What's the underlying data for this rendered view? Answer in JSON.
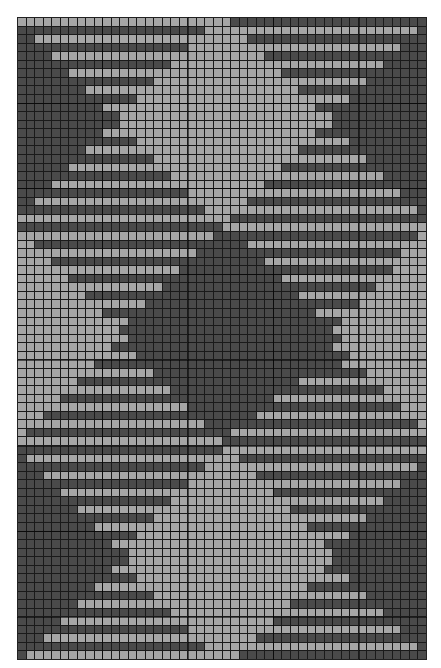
{
  "chart": {
    "cols": 48,
    "rows_count": 75,
    "colors": {
      "D": "#4a4a4a",
      "L": "#a6a6a6",
      "grid": "#1a1a1a"
    },
    "major_every": 10,
    "rows": [
      "LLLLLLLLLLLLLLLLLLLLLLLLLDDDDDDDDDDDDDDDDDDDDDDD",
      "DDDDDDDDDDDDDDDDDDDDDDLLLLLLLLLLLLLLLLLLLLLLLLLD",
      "DDLLLLLLLLLLLLLLLLLLLLLLLLLDDDDDDDDDDDDDDDDDDDDD",
      "DDDDDDDDDDDDDDDDDDDDLLLLLLLLLLLLLLLLLLLLLLLLLDDD",
      "DDDDLLLLLLLLLLLLLLLLLLLLLLLLLDDDDDDDDDDDDDDDDDDD",
      "DDDDDDDDDDDDDDDDDDLLLLLLLLLLLLLLLLLLLLLLLLLDDDDD",
      "DDDDDDLLLLLLLLLLLLLLLLLLLLLLLLLDDDDDDDDDDDDDDDDD",
      "DDDDDDDDDDDDDDDDLLLLLLLLLLLLLLLLLLLLLLLLLDDDDDDD",
      "DDDDDDDDLLLLLLLLLLLLLLLLLLLLLLLLLDDDDDDDDDDDDDDD",
      "DDDDDDDDDDDDDDLLLLLLLLLLLLLLLLLLLLLLLLLDDDDDDDDD",
      "DDDDDDDDDDLLLLLLLLLLLLLLLLLLLLLLLLLDDDDDDDDDDDDD",
      "DDDDDDDDDDDDLLLLLLLLLLLLLLLLLLLLLLLLLDDDDDDDDDDD",
      "DDDDDDDDDDDDLLLLLLLLLLLLLLLLLLLLLLLLLDDDDDDDDDDD",
      "DDDDDDDDDDLLLLLLLLLLLLLLLLLLLLLLLLLDDDDDDDDDDDDD",
      "DDDDDDDDDDDDDDLLLLLLLLLLLLLLLLLLLLLLLLLDDDDDDDDD",
      "DDDDDDDDLLLLLLLLLLLLLLLLLLLLLLLLLDDDDDDDDDDDDDDD",
      "DDDDDDDDDDDDDDDDLLLLLLLLLLLLLLLLLLLLLLLLLDDDDDDD",
      "DDDDDDLLLLLLLLLLLLLLLLLLLLLLLLLDDDDDDDDDDDDDDDDD",
      "DDDDDDDDDDDDDDDDDDLLLLLLLLLLLLLLLLLLLLLLLLLDDDDD",
      "DDDDLLLLLLLLLLLLLLLLLLLLLLLLLDDDDDDDDDDDDDDDDDDD",
      "DDDDDDDDDDDDDDDDDDDDLLLLLLLLLLLLLLLLLLLLLLLLLDDD",
      "DDLLLLLLLLLLLLLLLLLLLLLLLLLDDDDDDDDDDDDDDDDDDDDD",
      "DDDDDDDDDDDDDDDDDDDDDDLLLLLLLLLLLLLLLLLLLLLLLLLD",
      "LLLLLLLLLLLLLLLLLLLLLLLLLDDDDDDDDDDDDDDDDDDDDDDD",
      "DDDDDDDDDDDDDDDDDDDDDDDDLLLLLLLLLLLLLLLLLLLLLLLL",
      "LLLLLLLLLLLLLLLLLLLLLLLDDDDDDDDDDDDDDDDDDDDDDDDL",
      "LLDDDDDDDDDDDDDDDDDDDDDDDDDLLLLLLLLLLLLLLLLLLLLL",
      "LLLLLLLLLLLLLLLLLLLLLDDDDDDDDDDDDDDDDDDDDDDDDLLL",
      "LLLLDDDDDDDDDDDDDDDDDDDDDDDDDLLLLLLLLLLLLLLLLLLL",
      "LLLLLLLLLLLLLLLLLLLDDDDDDDDDDDDDDDDDDDDDDDDDLLLLL",
      "LLLLLLDDDDDDDDDDDDDDDDDDDDDDDDDLLLLLLLLLLLLLLLLL",
      "LLLLLLLLLLLLLLLLLDDDDDDDDDDDDDDDDDDDDDDDDDLLLLLLL",
      "LLLLLLLLDDDDDDDDDDDDDDDDDDDDDDDDDLLLLLLLLLLLLLLL",
      "LLLLLLLLLLLLLLLDDDDDDDDDDDDDDDDDDDDDDDDDLLLLLLLLL",
      "LLLLLLLLLLDDDDDDDDDDDDDDDDDDDDDDDDDLLLLLLLLLLLLL",
      "LLLLLLLLLLLLLDDDDDDDDDDDDDDDDDDDDDDDDDLLLLLLLLLLL",
      "LLLLLLLLLLLLDDDDDDDDDDDDDDDDDDDDDDDDDLLLLLLLLLLL",
      "LLLLLLLLLLLLLDDDDDDDDDDDDDDDDDDDDDDDDDLLLLLLLLLLL",
      "LLLLLLLLLLLDDDDDDDDDDDDDDDDDDDDDDDDDDLLLLLLLLLLLL",
      "LLLLLLLLLLLLLLDDDDDDDDDDDDDDDDDDDDDDDDDLLLLLLLLLL",
      "LLLLLLLLLDDDDDDDDDDDDDDDDDDDDDDDDDDDDDLLLLLLLLLLL",
      "LLLLLLLLLLLLLLLLDDDDDDDDDDDDDDDDDDDDDDDDDLLLLLLLL",
      "LLLLLLLDDDDDDDDDDDDDDDDDDDDDDDDDDLLLLLLLLLLLLLLLL",
      "LLLLLLLLLLLLLLLLLLDDDDDDDDDDDDDDDDDDDDDDDDDLLLLLL",
      "LLLLLDDDDDDDDDDDDDDDDDDDDDDDDDLLLLLLLLLLLLLLLLLLL",
      "LLLLLLLLLLLLLLLLLLLLDDDDDDDDDDDDDDDDDDDDDDDDDLLLL",
      "LLLDDDDDDDDDDDDDDDDDDDDDDDDDLLLLLLLLLLLLLLLLLLLLL",
      "LLLLLLLLLLLLLLLLLLLLLLDDDDDDDDDDDDDDDDDDDDDDDDDLL",
      "LDDDDDDDDDDDDDDDDDDDDDDDDLLLLLLLLLLLLLLLLLLLLLLL",
      "LLLLLLLLLLLLLLLLLLLLLLLLDDDDDDDDDDDDDDDDDDDDDDDD",
      "DDDDDDDDDDDDDDDDDDDDDDDDLLLLLLLLLLLLLLLLLLLLLLLL",
      "DLLLLLLLLLLLLLLLLLLLLLLLLLDDDDDDDDDDDDDDDDDDDDDD",
      "DDDDDDDDDDDDDDDDDDDDDDLLLLLLLLLLLLLLLLLLLLLLLLLD",
      "DDDLLLLLLLLLLLLLLLLLLLLLLLLLDDDDDDDDDDDDDDDDDDDD",
      "DDDDDDDDDDDDDDDDDDDDLLLLLLLLLLLLLLLLLLLLLLLLLDDD",
      "DDDDDLLLLLLLLLLLLLLLLLLLLLLLLLDDDDDDDDDDDDDDDDDD",
      "DDDDDDDDDDDDDDDDDDLLLLLLLLLLLLLLLLLLLLLLLLLDDDDD",
      "DDDDDDDLLLLLLLLLLLLLLLLLLLLLLLLLDDDDDDDDDDDDDDDD",
      "DDDDDDDDDDDDDDDDLLLLLLLLLLLLLLLLLLLLLLLLLDDDDDDD",
      "DDDDDDDDDLLLLLLLLLLLLLLLLLLLLLLLLLDDDDDDDDDDDDDD",
      "DDDDDDDDDDDDDDLLLLLLLLLLLLLLLLLLLLLLLLLDDDDDDDDD",
      "DDDDDDDDDDDLLLLLLLLLLLLLLLLLLLLLLLLLDDDDDDDDDDDD",
      "DDDDDDDDDDDDDLLLLLLLLLLLLLLLLLLLLLLLLDDDDDDDDDDD",
      "DDDDDDDDDDDDDLLLLLLLLLLLLLLLLLLLLLLLLDDDDDDDDDDD",
      "DDDDDDDDDDDLLLLLLLLLLLLLLLLLLLLLLLLLDDDDDDDDDDDD",
      "DDDDDDDDDDDDDDLLLLLLLLLLLLLLLLLLLLLLLLLDDDDDDDDD",
      "DDDDDDDDDLLLLLLLLLLLLLLLLLLLLLLLLLDDDDDDDDDDDDDD",
      "DDDDDDDDDDDDDDDDLLLLLLLLLLLLLLLLLLLLLLLLLDDDDDDD",
      "DDDDDDDLLLLLLLLLLLLLLLLLLLLLLLLLDDDDDDDDDDDDDDDD",
      "DDDDDDDDDDDDDDDDDDLLLLLLLLLLLLLLLLLLLLLLLLLDDDDD",
      "DDDDDLLLLLLLLLLLLLLLLLLLLLLLLLDDDDDDDDDDDDDDDDDD",
      "DDDDDDDDDDDDDDDDDDDDLLLLLLLLLLLLLLLLLLLLLLLLLDDD",
      "DDDLLLLLLLLLLLLLLLLLLLLLLLLLDDDDDDDDDDDDDDDDDDDD",
      "DDDDDDDDDDDDDDDDDDDDDDLLLLLLLLLLLLLLLLLLLLLLLLLD",
      "DLLLLLLLLLLLLLLLLLLLLLLLLLDDDDDDDDDDDDDDDDDDDDDD"
    ]
  }
}
